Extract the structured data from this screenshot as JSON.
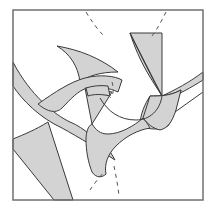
{
  "figure": {
    "title": "",
    "width": 214,
    "height": 212,
    "colors": {
      "background": "#ffffff",
      "fill": "#d3d3d3",
      "stroke": "#3a3a3a",
      "frame": "#707070",
      "dash": "#555555"
    },
    "frame": {
      "x": 13,
      "y": 10,
      "width": 190,
      "height": 190
    },
    "shapes": [
      {
        "name": "left-diagonal-band",
        "d": "M13 62 C30 95, 55 115, 70 122 C85 128, 95 140, 108 148 L115 160 C100 150, 80 138, 62 128 C40 118, 22 100, 13 86 Z"
      },
      {
        "name": "top-left-hook",
        "d": "M57 46 C80 50, 100 58, 118 72 C100 72, 88 76, 80 82 C78 66, 70 54, 57 46 Z"
      },
      {
        "name": "left-lower-wedge",
        "d": "M13 139 C25 134, 35 130, 48 122 L73 200 L54 200 L13 149 Z"
      },
      {
        "name": "central-arc-band",
        "d": "M38 104 C55 92, 70 82, 85 78 C100 74, 115 76, 122 80 L118 92 C110 88, 98 86, 88 88 C78 90, 70 100, 62 108 C55 115, 45 110, 38 104 Z"
      },
      {
        "name": "center-triangle",
        "d": "M85 88 L112 92 L92 124 Z"
      },
      {
        "name": "center-tab",
        "d": "M86 88 C92 86, 100 85, 108 86 L110 96 C102 94, 94 94, 88 96 Z"
      },
      {
        "name": "top-right-block",
        "d": "M130 33 L162 33 L162 72 L162 96 C152 80, 140 64, 130 33 Z M130 33 C142 58, 152 78, 162 96 Z"
      },
      {
        "name": "right-diagonal-arm",
        "d": "M162 96 C175 90, 190 82, 203 72 L203 80 C190 88, 180 94, 168 98 Z"
      },
      {
        "name": "center-right-lobe",
        "d": "M150 96 C160 96, 170 96, 181 90 C176 104, 174 116, 168 126 C160 130, 150 130, 140 126 C140 114, 145 104, 150 96 Z"
      },
      {
        "name": "bottom-center-body",
        "d": "M92 124 C96 130, 100 134, 108 134 C120 134, 134 126, 143 118 C148 124, 150 128, 150 128 C138 130, 126 136, 116 146 C108 154, 104 164, 106 174 C102 178, 96 178, 92 172 C88 162, 86 150, 86 140 C86 132, 88 126, 92 124 Z"
      },
      {
        "name": "bottom-right-wedge",
        "d": "M150 96 L143 118 C148 124, 152 128, 160 130 C168 128, 172 122, 176 110 L181 90 C170 96, 160 96, 150 96 Z"
      }
    ],
    "lines": [
      {
        "name": "right-thin-line",
        "d": "M175 112 L203 92"
      },
      {
        "name": "arc-line-inner",
        "d": "M100 98 C108 112, 120 120, 136 120 C150 120, 160 110, 162 96"
      }
    ],
    "dashed": [
      {
        "name": "dashed-top-left",
        "d": "M86 12 C92 22, 98 30, 104 36"
      },
      {
        "name": "dashed-top-right",
        "d": "M166 12 C162 20, 158 28, 152 36"
      },
      {
        "name": "dashed-bottom-left",
        "d": "M90 190 C94 184, 100 176, 106 170"
      },
      {
        "name": "dashed-bottom-right",
        "d": "M114 166 C116 176, 118 186, 119 196"
      },
      {
        "name": "dashed-center",
        "d": "M112 82 C114 88, 114 94, 110 98"
      }
    ]
  }
}
